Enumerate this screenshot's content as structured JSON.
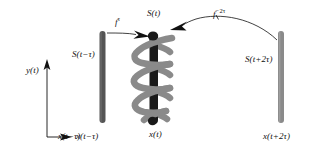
{
  "figure": {
    "background_color": "#ffffff"
  },
  "axes": {
    "y_label": "y(t)",
    "x_label": "x(t−τ)",
    "color": "#111111"
  },
  "objects": {
    "left_bar": {
      "state_label": "S(t−τ)",
      "axis_label": "x(t−τ)",
      "color": "#555555"
    },
    "center_bar": {
      "state_label": "S(t)",
      "axis_label": "x(t)",
      "color": "#1a1a1a"
    },
    "helix": {
      "color": "#8a8a8a"
    },
    "right_bar": {
      "state_label": "S(t+2τ)",
      "axis_label": "x(t+2τ)",
      "color": "#8a8a8a"
    }
  },
  "arrows": {
    "forward": {
      "operator": "f",
      "exponent": "τ",
      "color": "#111111"
    },
    "backward": {
      "operator": "f",
      "exponent": "−2τ",
      "color": "#111111"
    }
  }
}
